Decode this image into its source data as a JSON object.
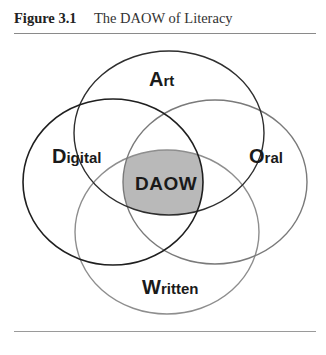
{
  "caption": {
    "figure_number": "Figure 3.1",
    "title": "The DAOW of Literacy"
  },
  "diagram": {
    "type": "venn",
    "sets": [
      {
        "id": "art",
        "initial": "A",
        "rest": "rt",
        "label": "Art",
        "stroke": "#2e2e2e"
      },
      {
        "id": "digital",
        "initial": "D",
        "rest": "igital",
        "label": "Digital",
        "stroke": "#1f1f1f"
      },
      {
        "id": "oral",
        "initial": "O",
        "rest": "ral",
        "label": "Oral",
        "stroke": "#7a7a7a"
      },
      {
        "id": "written",
        "initial": "W",
        "rest": "ritten",
        "label": "Written",
        "stroke": "#8e8e8e"
      }
    ],
    "intersection": {
      "label": "DAOW",
      "fill": "#b9b9b9"
    }
  }
}
